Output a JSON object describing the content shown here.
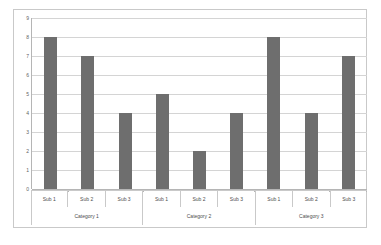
{
  "chart_data": {
    "type": "bar",
    "title": "",
    "xlabel": "",
    "ylabel": "",
    "ylim": [
      0,
      9
    ],
    "y_ticks": [
      "0",
      "1",
      "2",
      "3",
      "4",
      "5",
      "6",
      "7",
      "8",
      "9"
    ],
    "grid": true,
    "legend": "none",
    "groups": [
      "Category 1",
      "Category 2",
      "Category 3"
    ],
    "categories": [
      "Sub 1",
      "Sub 2",
      "Sub 3"
    ],
    "bars": [
      {
        "group": "Category 1",
        "category": "Sub 1",
        "value": 8
      },
      {
        "group": "Category 1",
        "category": "Sub 2",
        "value": 7
      },
      {
        "group": "Category 1",
        "category": "Sub 3",
        "value": 4
      },
      {
        "group": "Category 2",
        "category": "Sub 1",
        "value": 5
      },
      {
        "group": "Category 2",
        "category": "Sub 2",
        "value": 2
      },
      {
        "group": "Category 2",
        "category": "Sub 3",
        "value": 4
      },
      {
        "group": "Category 3",
        "category": "Sub 1",
        "value": 8
      },
      {
        "group": "Category 3",
        "category": "Sub 2",
        "value": 4
      },
      {
        "group": "Category 3",
        "category": "Sub 3",
        "value": 7
      }
    ],
    "series": [
      {
        "name": "Category 1",
        "values": [
          8,
          7,
          4
        ]
      },
      {
        "name": "Category 2",
        "values": [
          5,
          2,
          4
        ]
      },
      {
        "name": "Category 3",
        "values": [
          8,
          4,
          7
        ]
      }
    ],
    "colors": {
      "bar": "#6e6e6e",
      "gridline": "#d4d4d4",
      "axis": "#b5b5b5",
      "frame": "#c9c9c9",
      "plot_background": "#ffffff",
      "tick_label": "#5f5f5f"
    }
  }
}
